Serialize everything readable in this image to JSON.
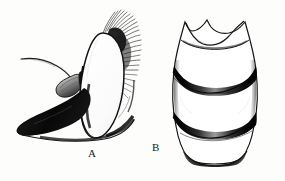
{
  "figure": {
    "kind": "scientific-illustration",
    "medium": "ink line drawing, monochrome",
    "background_color": "#fdfdfc",
    "ink_color": "#101010",
    "width_px": 285,
    "height_px": 181,
    "panels": [
      {
        "id": "A",
        "label": "A",
        "label_x": 88,
        "label_y": 147,
        "view": "lateral view of head",
        "parts": [
          "arista (long tapering bristle curving up and to the left)",
          "antennal segment (small dark pedicel / first flagellomere, oval)",
          "compound eye (large pale oval, outlined)",
          "occipital bristle row (dense hair fringe along upper right margin)",
          "gena / proboscis region (solid black wedge below eye)",
          "ventral margin (thin curved line sweeping right)"
        ]
      },
      {
        "id": "B",
        "label": "B",
        "label_x": 152,
        "label_y": 141,
        "view": "dorsal view of abdomen",
        "parts": [
          "tergite 1 notch (deep median emargination at anterior margin)",
          "tergite 1+2 (broad anterior plate)",
          "tergite 3 (separated by dark transverse band)",
          "tergite 4 (separated by second dark transverse band)",
          "tergite 5 (terminal segment, narrowed posteriorly)",
          "dark lateral margins",
          "posterior margin band"
        ],
        "band_count": 3
      }
    ]
  },
  "labels": {
    "a": "A",
    "b": "B"
  }
}
